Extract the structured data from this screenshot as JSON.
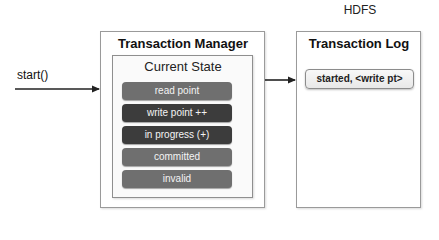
{
  "diagram": {
    "hdfs_label": "HDFS",
    "entry_call": "start()",
    "transaction_manager": {
      "title": "Transaction Manager",
      "current_state": {
        "title": "Current State",
        "items": [
          {
            "label": "read point",
            "color": "#6f6f6f"
          },
          {
            "label": "write point ++",
            "color": "#3c3c3c"
          },
          {
            "label": "in progress (+)",
            "color": "#3c3c3c"
          },
          {
            "label": "committed",
            "color": "#6f6f6f"
          },
          {
            "label": "invalid",
            "color": "#6f6f6f"
          }
        ]
      }
    },
    "transaction_log": {
      "title": "Transaction Log",
      "entries": [
        {
          "label": "started, <write pt>"
        }
      ]
    },
    "edges": [
      {
        "from": "start()",
        "to": "Transaction Manager"
      },
      {
        "from": "Transaction Manager",
        "to": "Transaction Log"
      }
    ]
  }
}
